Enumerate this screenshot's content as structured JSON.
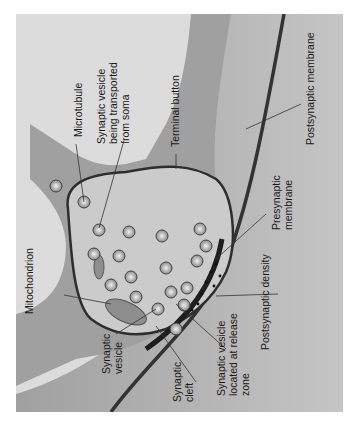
{
  "figure": {
    "orientation": "rotated 90deg counter-clockwise",
    "colors": {
      "background": "#dcdcdc",
      "presynaptic_axon": "#9a9a9a",
      "terminal_interior": "#c9c9c9",
      "membrane_dark": "#3a3a3a",
      "postsynaptic_region": "#a8a8a8",
      "density": "#1e1e1e"
    },
    "labels": {
      "microtubule": "Microtubule",
      "vesicle_transported": "Synaptic vesicle\nbeing transported\nfrom soma",
      "terminal_button": "Terminal button",
      "postsynaptic_membrane": "Postsynaptic membrane",
      "presynaptic_membrane": "Presynaptic\nmembrane",
      "postsynaptic_density": "Postsynaptic density",
      "vesicle_release_zone": "Synaptic vesicle\nlocated at release\nzone",
      "synaptic_cleft": "Synaptic\ncleft",
      "synaptic_vesicle": "Synaptic\nvesicle",
      "mitochondrion": "Mitochondrion"
    }
  }
}
